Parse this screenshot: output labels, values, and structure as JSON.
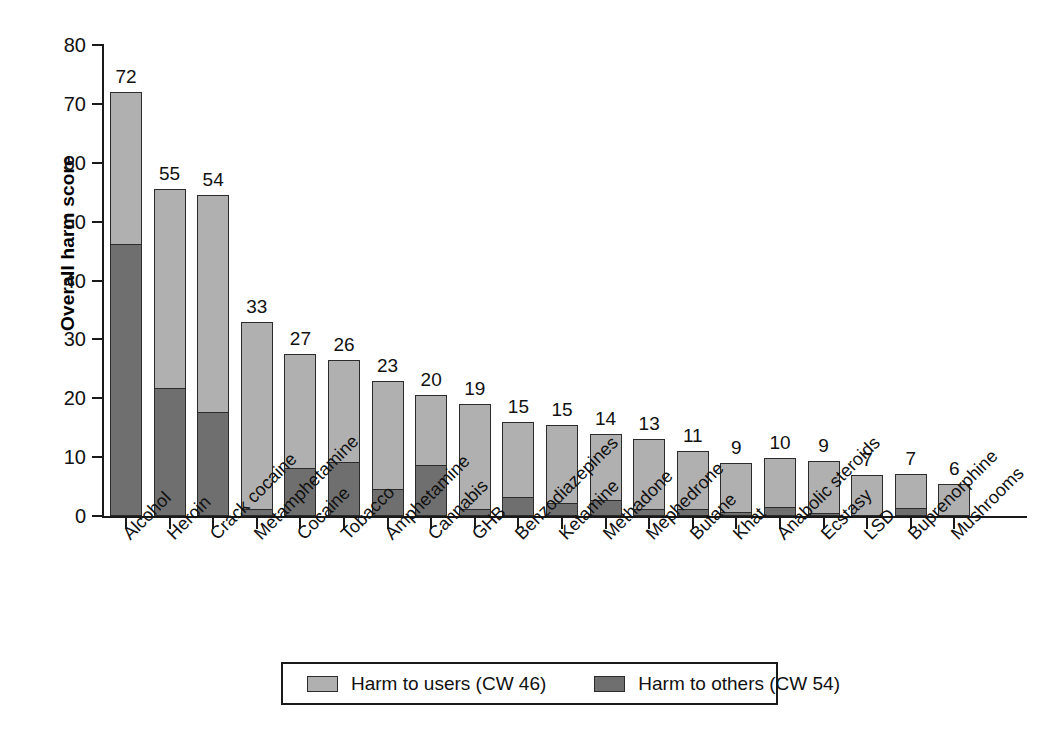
{
  "chart_data": {
    "type": "bar",
    "subtype": "stacked-bar",
    "title": "",
    "xlabel": "",
    "ylabel": "Overall harm score",
    "ylim": [
      0,
      80
    ],
    "yticks": [
      0,
      10,
      20,
      30,
      40,
      50,
      60,
      70,
      80
    ],
    "grid": false,
    "legend_position": "bottom",
    "categories": [
      "Alcohol",
      "Heroin",
      "Crack cocaine",
      "Metamphetamine",
      "Cocaine",
      "Tobacco",
      "Amphetamine",
      "Cannabis",
      "GHB",
      "Benzodiazepines",
      "Ketamine",
      "Methadone",
      "Mephedrone",
      "Butane",
      "Khat",
      "Anabolic steroids",
      "Ecstasy",
      "LSD",
      "Buprenorphine",
      "Mushrooms"
    ],
    "series": [
      {
        "name": "Harm to users (CW 46)",
        "color": "#b0b0b0",
        "values": [
          26,
          34,
          37,
          32,
          19.5,
          17.5,
          18.5,
          12,
          18,
          13,
          13.5,
          11.5,
          12,
          10,
          8.5,
          8.5,
          9,
          7,
          6,
          5.5
        ]
      },
      {
        "name": "Harm to others (CW 54)",
        "color": "#6f6f6f",
        "values": [
          46,
          21.5,
          17.5,
          1,
          8,
          9,
          4.5,
          8.5,
          1,
          3,
          2,
          2.5,
          1,
          1,
          0.5,
          1.3,
          0.4,
          0,
          1.2,
          0
        ]
      }
    ],
    "totals": [
      72,
      55,
      54,
      33,
      27,
      26,
      23,
      20,
      19,
      15,
      15,
      14,
      13,
      11,
      9,
      10,
      9,
      7,
      7,
      6
    ],
    "data_labels": [
      "72",
      "55",
      "54",
      "33",
      "27",
      "26",
      "23",
      "20",
      "19",
      "15",
      "15",
      "14",
      "13",
      "11",
      "9",
      "10",
      "9",
      "7",
      "7",
      "6"
    ]
  },
  "axis": {
    "y_title": "Overall harm score",
    "y_tick_labels": [
      "80",
      "70",
      "60",
      "50",
      "40",
      "30",
      "20",
      "10",
      "0"
    ]
  },
  "legend": {
    "items": [
      {
        "label": "Harm to users (CW 46)",
        "swatch": "light"
      },
      {
        "label": "Harm to others (CW 54)",
        "swatch": "dark"
      }
    ]
  },
  "colors": {
    "harm_to_users": "#b0b0b0",
    "harm_to_others": "#6f6f6f",
    "axis": "#1a1a1a",
    "text": "#111111",
    "background": "#ffffff"
  }
}
